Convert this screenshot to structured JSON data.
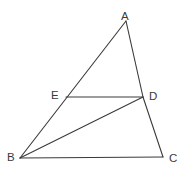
{
  "figure": {
    "background_color": "#ffffff",
    "line_color": "#3a3a3a",
    "label_color": "#3a3a3a",
    "width": 185,
    "height": 172
  },
  "labels": {
    "a": "A",
    "b": "B",
    "c": "C",
    "d": "D",
    "e": "E"
  },
  "chart_data": {
    "type": "scatter",
    "title": "",
    "xlabel": "",
    "ylabel": "",
    "grid": false,
    "legend": "none",
    "xlim": [
      0,
      185
    ],
    "ylim": [
      172,
      0
    ],
    "points": [
      {
        "name": "A",
        "x": 126,
        "y": 21,
        "label": "A",
        "label_x": 121,
        "label_y": 10
      },
      {
        "name": "B",
        "x": 20,
        "y": 158,
        "label": "B",
        "label_x": 7,
        "label_y": 151
      },
      {
        "name": "C",
        "x": 163,
        "y": 157,
        "label": "C",
        "label_x": 169,
        "label_y": 152
      },
      {
        "name": "D",
        "x": 143,
        "y": 97,
        "label": "D",
        "label_x": 149,
        "label_y": 90
      },
      {
        "name": "E",
        "x": 66,
        "y": 97,
        "label": "E",
        "label_x": 51,
        "label_y": 89
      }
    ],
    "segments": [
      {
        "name": "AB",
        "from": "A",
        "to": "B",
        "x1": 126,
        "y1": 21,
        "x2": 20,
        "y2": 158
      },
      {
        "name": "AC",
        "from": "A",
        "to": "C",
        "x1": 126,
        "y1": 21,
        "x2": 163,
        "y2": 157
      },
      {
        "name": "BC",
        "from": "B",
        "to": "C",
        "x1": 20,
        "y1": 158,
        "x2": 163,
        "y2": 157
      },
      {
        "name": "ED",
        "from": "E",
        "to": "D",
        "x1": 66,
        "y1": 97,
        "x2": 143,
        "y2": 97
      },
      {
        "name": "BD",
        "from": "B",
        "to": "D",
        "x1": 20,
        "y1": 158,
        "x2": 143,
        "y2": 97
      }
    ]
  }
}
